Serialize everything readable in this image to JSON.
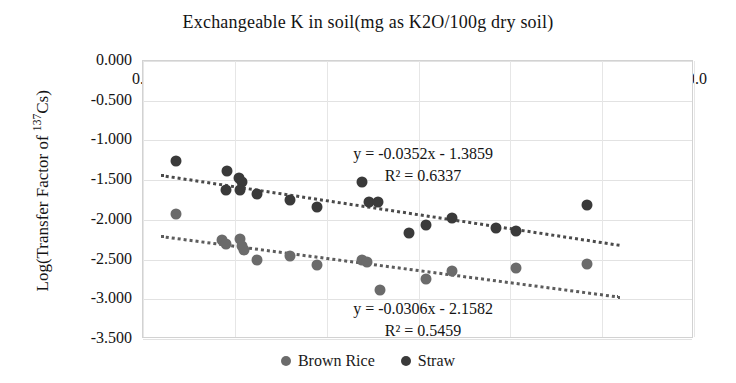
{
  "chart_data": {
    "type": "scatter",
    "title": "Exchangeable K in soil(mg as K2O/100g dry soil)",
    "xlabel": "Exchangeable K in soil(mg as K2O/100g dry soil)",
    "ylabel": "Log(Transfer Factor of 137Cs)",
    "ylabel_prefix": "Log(Transfer Factor of ",
    "ylabel_sup": "137",
    "ylabel_suffix": "Cs)",
    "xlim": [
      0.0,
      30.0
    ],
    "ylim": [
      -3.5,
      0.0
    ],
    "grid": true,
    "legend_position": "bottom",
    "xticks": [
      "0.0",
      "5.0",
      "10.0",
      "15.0",
      "20.0",
      "25.0",
      "30.0"
    ],
    "xtick_values": [
      0,
      5,
      10,
      15,
      20,
      25,
      30
    ],
    "yticks": [
      "0.000",
      "-0.500",
      "-1.000",
      "-1.500",
      "-2.000",
      "-2.500",
      "-3.000",
      "-3.500"
    ],
    "ytick_values": [
      0.0,
      -0.5,
      -1.0,
      -1.5,
      -2.0,
      -2.5,
      -3.0,
      -3.5
    ],
    "colors": {
      "straw": "#3a3a3a",
      "brown_rice": "#6b6b6b",
      "trendline": "#4a4a4a",
      "grid": "#e2e2e2",
      "axis": "#d2d2d2"
    },
    "series": [
      {
        "name": "Straw",
        "color": "#3a3a3a",
        "points": [
          [
            1.8,
            -1.26
          ],
          [
            4.6,
            -1.38
          ],
          [
            5.2,
            -1.47
          ],
          [
            5.4,
            -1.52
          ],
          [
            4.5,
            -1.62
          ],
          [
            5.3,
            -1.63
          ],
          [
            6.2,
            -1.68
          ],
          [
            8.0,
            -1.75
          ],
          [
            9.5,
            -1.84
          ],
          [
            11.9,
            -1.52
          ],
          [
            12.3,
            -1.77
          ],
          [
            12.8,
            -1.78
          ],
          [
            14.5,
            -2.17
          ],
          [
            15.4,
            -2.06
          ],
          [
            16.8,
            -1.98
          ],
          [
            19.2,
            -2.1
          ],
          [
            20.3,
            -2.14
          ],
          [
            24.2,
            -1.81
          ]
        ]
      },
      {
        "name": "Brown Rice",
        "color": "#6b6b6b",
        "points": [
          [
            1.8,
            -1.92
          ],
          [
            4.3,
            -2.25
          ],
          [
            4.5,
            -2.3
          ],
          [
            5.3,
            -2.24
          ],
          [
            5.4,
            -2.33
          ],
          [
            5.5,
            -2.38
          ],
          [
            6.2,
            -2.5
          ],
          [
            8.0,
            -2.45
          ],
          [
            9.5,
            -2.57
          ],
          [
            11.9,
            -2.5
          ],
          [
            12.2,
            -2.53
          ],
          [
            12.9,
            -2.88
          ],
          [
            15.4,
            -2.74
          ],
          [
            16.8,
            -2.64
          ],
          [
            20.3,
            -2.61
          ],
          [
            24.2,
            -2.55
          ]
        ]
      }
    ],
    "trendlines": [
      {
        "for": "Straw",
        "slope": -0.0352,
        "intercept": -1.3859,
        "equation": "y = -0.0352x - 1.3859",
        "r_squared_label": "R² = 0.6337",
        "r_squared": 0.6337,
        "x_start": 1.0,
        "x_end": 26.0
      },
      {
        "for": "Brown Rice",
        "slope": -0.0306,
        "intercept": -2.1582,
        "equation": "y = -0.0306x - 2.1582",
        "r_squared_label": "R² = 0.5459",
        "r_squared": 0.5459,
        "x_start": 1.0,
        "x_end": 26.0
      }
    ],
    "legend": [
      {
        "label": "Brown Rice",
        "color": "#6b6b6b"
      },
      {
        "label": "Straw",
        "color": "#3a3a3a"
      }
    ]
  }
}
